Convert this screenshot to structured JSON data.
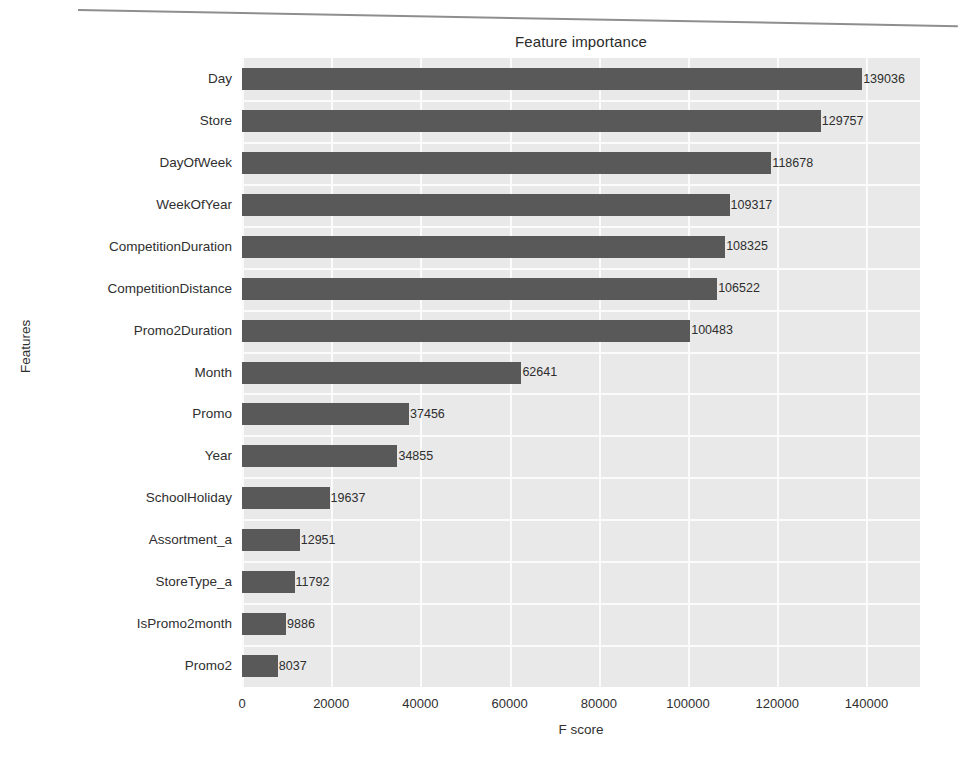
{
  "chart_data": {
    "type": "bar",
    "orientation": "horizontal",
    "title": "Feature importance",
    "xlabel": "F score",
    "ylabel": "Features",
    "categories": [
      "Day",
      "Store",
      "DayOfWeek",
      "WeekOfYear",
      "CompetitionDuration",
      "CompetitionDistance",
      "Promo2Duration",
      "Month",
      "Promo",
      "Year",
      "SchoolHoliday",
      "Assortment_a",
      "StoreType_a",
      "IsPromo2month",
      "Promo2"
    ],
    "values": [
      139036,
      129757,
      118678,
      109317,
      108325,
      106522,
      100483,
      62641,
      37456,
      34855,
      19637,
      12951,
      11792,
      9886,
      8037
    ],
    "value_labels": [
      "139036",
      "129757",
      "118678",
      "109317",
      "108325",
      "106522",
      "100483",
      "62641",
      "37456",
      "34855",
      "19637",
      "12951",
      "11792",
      "9886",
      "8037"
    ],
    "xticks": [
      0,
      20000,
      40000,
      60000,
      80000,
      100000,
      120000,
      140000
    ],
    "xtick_labels": [
      "0",
      "20000",
      "40000",
      "60000",
      "80000",
      "100000",
      "120000",
      "140000"
    ],
    "xlim": [
      0,
      152000
    ],
    "grid": true,
    "legend": null,
    "colors": {
      "bar": "#595959",
      "plot_background": "#e9e9e9",
      "gridline": "#fbfbfb",
      "text": "#2f2f2f",
      "page_background": "#ffffff"
    }
  }
}
